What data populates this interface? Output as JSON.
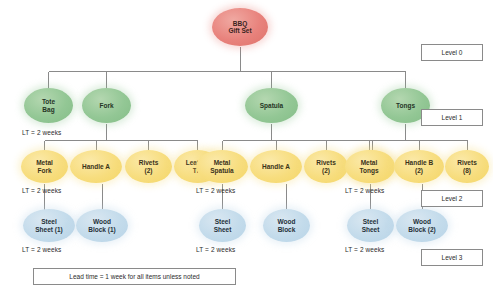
{
  "diagram": {
    "legend_note": "Lead time  =  1 week for all items unless noted",
    "colors": {
      "root": "#e8827c",
      "level1": "#93c795",
      "level2": "#f7dd7e",
      "level3": "#c3dbeb",
      "connector": "#8a8a8a",
      "box_border": "#8a8a8a"
    },
    "level_markers": [
      {
        "label": "Level 0",
        "x": 421,
        "y": 44,
        "w": 62,
        "h": 17
      },
      {
        "label": "Level 1",
        "x": 421,
        "y": 109,
        "w": 62,
        "h": 17
      },
      {
        "label": "Level 2",
        "x": 421,
        "y": 190,
        "w": 62,
        "h": 17
      },
      {
        "label": "Level 3",
        "x": 421,
        "y": 249,
        "w": 62,
        "h": 17
      }
    ],
    "lead_times": [
      {
        "text": "LT  =  2 weeks",
        "x": 22,
        "y": 129
      },
      {
        "text": "LT  =  2 weeks",
        "x": 22,
        "y": 187
      },
      {
        "text": "LT  =  2 weeks",
        "x": 22,
        "y": 246
      },
      {
        "text": "LT  =  2 weeks",
        "x": 196,
        "y": 187
      },
      {
        "text": "LT  =  2 weeks",
        "x": 196,
        "y": 246
      },
      {
        "text": "LT  =  2 weeks",
        "x": 345,
        "y": 187
      },
      {
        "text": "LT  =  2 weeks",
        "x": 345,
        "y": 246
      }
    ],
    "nodes": [
      {
        "label": "BBQ\nGift Set",
        "level": "root",
        "x": 212,
        "y": 8,
        "w": 56,
        "h": 38
      },
      {
        "label": "Tote\nBag",
        "level": "lvl1",
        "x": 24,
        "y": 88,
        "w": 49,
        "h": 35
      },
      {
        "label": "Fork",
        "level": "lvl1",
        "x": 82,
        "y": 88,
        "w": 49,
        "h": 35
      },
      {
        "label": "Spatula",
        "level": "lvl1",
        "x": 245,
        "y": 88,
        "w": 53,
        "h": 35
      },
      {
        "label": "Tongs",
        "level": "lvl1",
        "x": 381,
        "y": 88,
        "w": 49,
        "h": 35
      },
      {
        "label": "Metal\nFork",
        "level": "lvl2",
        "x": 21,
        "y": 150,
        "w": 47,
        "h": 33
      },
      {
        "label": "Handle A",
        "level": "lvl2",
        "x": 70,
        "y": 150,
        "w": 52,
        "h": 33
      },
      {
        "label": "Rivets\n(2)",
        "level": "lvl2",
        "x": 125,
        "y": 150,
        "w": 47,
        "h": 33
      },
      {
        "label": "Leather\nTie",
        "level": "lvl2",
        "x": 174,
        "y": 150,
        "w": 47,
        "h": 33
      },
      {
        "label": "Metal\nSpatula",
        "level": "lvl2",
        "x": 196,
        "y": 150,
        "w": 52,
        "h": 33
      },
      {
        "label": "Handle A",
        "level": "lvl2",
        "x": 250,
        "y": 150,
        "w": 52,
        "h": 33
      },
      {
        "label": "Rivets\n(2)",
        "level": "lvl2",
        "x": 304,
        "y": 150,
        "w": 44,
        "h": 33
      },
      {
        "label": "Leather\nTie",
        "level": "lvl2",
        "x": 349,
        "y": 150,
        "w": 46,
        "h": 33
      },
      {
        "label": "Metal\nTongs",
        "level": "lvl2",
        "x": 345,
        "y": 150,
        "w": 48,
        "h": 33
      },
      {
        "label": "Handle B\n(2)",
        "level": "lvl2",
        "x": 394,
        "y": 150,
        "w": 50,
        "h": 33
      },
      {
        "label": "Rivets\n(8)",
        "level": "lvl2",
        "x": 445,
        "y": 150,
        "w": 44,
        "h": 33
      },
      {
        "label": "Steel\nSheet (1)",
        "level": "lvl3",
        "x": 23,
        "y": 209,
        "w": 52,
        "h": 33
      },
      {
        "label": "Wood\nBlock (1)",
        "level": "lvl3",
        "x": 76,
        "y": 209,
        "w": 52,
        "h": 33
      },
      {
        "label": "Steel\nSheet",
        "level": "lvl3",
        "x": 199,
        "y": 209,
        "w": 47,
        "h": 33
      },
      {
        "label": "Wood\nBlock",
        "level": "lvl3",
        "x": 263,
        "y": 209,
        "w": 47,
        "h": 33
      },
      {
        "label": "Steel\nSheet",
        "level": "lvl3",
        "x": 347,
        "y": 209,
        "w": 47,
        "h": 33
      },
      {
        "label": "Wood\nBlock (2)",
        "level": "lvl3",
        "x": 396,
        "y": 209,
        "w": 52,
        "h": 33
      }
    ],
    "legend_box": {
      "x": 33,
      "y": 268,
      "w": 203,
      "h": 17
    }
  },
  "chart_data": {
    "type": "diagram",
    "subtype": "bill-of-materials-tree",
    "levels": [
      {
        "level": 0,
        "marker": "Level 0",
        "items": [
          {
            "name": "BBQ Gift Set",
            "quantity": 1,
            "lead_time": "1 week"
          }
        ]
      },
      {
        "level": 1,
        "marker": "Level 1",
        "lead_time_note": "LT = 2 weeks",
        "items": [
          {
            "name": "Tote Bag",
            "quantity": 1,
            "parent": "BBQ Gift Set",
            "lead_time": "2 weeks"
          },
          {
            "name": "Fork",
            "quantity": 1,
            "parent": "BBQ Gift Set",
            "lead_time": "1 week"
          },
          {
            "name": "Spatula",
            "quantity": 1,
            "parent": "BBQ Gift Set",
            "lead_time": "1 week"
          },
          {
            "name": "Tongs",
            "quantity": 1,
            "parent": "BBQ Gift Set",
            "lead_time": "1 week"
          }
        ]
      },
      {
        "level": 2,
        "marker": "Level 2",
        "lead_time_note": "LT = 2 weeks",
        "items": [
          {
            "name": "Metal Fork",
            "quantity": 1,
            "parent": "Fork",
            "lead_time": "2 weeks"
          },
          {
            "name": "Handle A",
            "quantity": 1,
            "parent": "Fork",
            "lead_time": "1 week"
          },
          {
            "name": "Rivets",
            "quantity": 2,
            "parent": "Fork",
            "lead_time": "1 week"
          },
          {
            "name": "Leather Tie",
            "quantity": 1,
            "parent": "Fork",
            "lead_time": "1 week"
          },
          {
            "name": "Metal Spatula",
            "quantity": 1,
            "parent": "Spatula",
            "lead_time": "2 weeks"
          },
          {
            "name": "Handle A",
            "quantity": 1,
            "parent": "Spatula",
            "lead_time": "1 week"
          },
          {
            "name": "Rivets",
            "quantity": 2,
            "parent": "Spatula",
            "lead_time": "1 week"
          },
          {
            "name": "Leather Tie",
            "quantity": 1,
            "parent": "Spatula",
            "lead_time": "1 week"
          },
          {
            "name": "Metal Tongs",
            "quantity": 1,
            "parent": "Tongs",
            "lead_time": "2 weeks"
          },
          {
            "name": "Handle B",
            "quantity": 2,
            "parent": "Tongs",
            "lead_time": "1 week"
          },
          {
            "name": "Rivets",
            "quantity": 8,
            "parent": "Tongs",
            "lead_time": "1 week"
          }
        ]
      },
      {
        "level": 3,
        "marker": "Level 3",
        "lead_time_note": "LT = 2 weeks",
        "items": [
          {
            "name": "Steel Sheet",
            "quantity": 1,
            "parent": "Metal Fork",
            "lead_time": "2 weeks"
          },
          {
            "name": "Wood Block",
            "quantity": 1,
            "parent": "Handle A",
            "lead_time": "2 weeks"
          },
          {
            "name": "Steel Sheet",
            "quantity": 1,
            "parent": "Metal Spatula",
            "lead_time": "2 weeks"
          },
          {
            "name": "Wood Block",
            "quantity": 1,
            "parent": "Handle A",
            "lead_time": "2 weeks"
          },
          {
            "name": "Steel Sheet",
            "quantity": 1,
            "parent": "Metal Tongs",
            "lead_time": "2 weeks"
          },
          {
            "name": "Wood Block",
            "quantity": 2,
            "parent": "Handle B",
            "lead_time": "2 weeks"
          }
        ]
      }
    ],
    "notes": "Lead time = 1 week for all items unless noted"
  }
}
